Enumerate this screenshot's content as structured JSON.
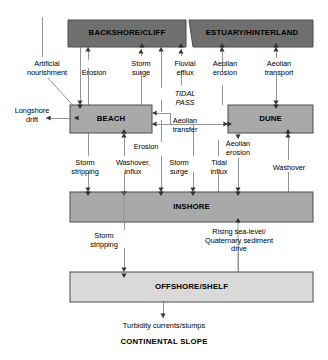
{
  "diagram": {
    "colors": {
      "dark_box_fill": "#6f6f6f",
      "mid_box_fill": "#a9a9a9",
      "light_box_fill": "#d9d9d9",
      "box_stroke": "#4d4d4d",
      "line": "#808080",
      "arrow": "#3a3a3a",
      "text": "#000000",
      "background": "#ffffff"
    },
    "boxes": [
      {
        "id": "backshore",
        "label": "BACKSHORE/CLIFF",
        "tone": "dark",
        "x": 68,
        "y": 20,
        "w": 118,
        "h": 27
      },
      {
        "id": "estuary",
        "label": "ESTUARY/HINTERLAND",
        "tone": "dark",
        "x": 191,
        "y": 20,
        "w": 122,
        "h": 27
      },
      {
        "id": "beach",
        "label": "BEACH",
        "tone": "mid",
        "x": 70,
        "y": 105,
        "w": 82,
        "h": 28
      },
      {
        "id": "dune",
        "label": "DUNE",
        "tone": "mid",
        "x": 228,
        "y": 105,
        "w": 85,
        "h": 28
      },
      {
        "id": "inshore",
        "label": "INSHORE",
        "tone": "mid",
        "x": 70,
        "y": 192,
        "w": 243,
        "h": 30
      },
      {
        "id": "offshore",
        "label": "OFFSHORE/SHELF",
        "tone": "light",
        "x": 70,
        "y": 272,
        "w": 243,
        "h": 30
      }
    ],
    "flow_labels": [
      {
        "id": "artificial-nourishment",
        "text": "Artificial\nnourishment",
        "x": 6,
        "y": 60,
        "w": 82,
        "italic": false
      },
      {
        "id": "erosion-backshore",
        "text": "Erosion",
        "x": 72,
        "y": 69,
        "w": 44,
        "italic": false
      },
      {
        "id": "storm-surge-backshore",
        "text": "Storm\nsurge",
        "x": 118,
        "y": 60,
        "w": 46,
        "italic": false
      },
      {
        "id": "fluvial-efflux",
        "text": "Fluvial\nefflux",
        "x": 162,
        "y": 60,
        "w": 46,
        "italic": false
      },
      {
        "id": "aeolian-erosion-top",
        "text": "Aeolian\nerosion",
        "x": 203,
        "y": 60,
        "w": 46,
        "italic": false
      },
      {
        "id": "aeolian-transport",
        "text": "Aeolian\ntransport",
        "x": 252,
        "y": 60,
        "w": 56,
        "italic": false
      },
      {
        "id": "tidal-pass",
        "text": "TIDAL\nPASS",
        "x": 162,
        "y": 90,
        "w": 46,
        "italic": true
      },
      {
        "id": "longshore-drift",
        "text": "Longshore\ndrift",
        "x": 5,
        "y": 107,
        "w": 56,
        "italic": false
      },
      {
        "id": "aeolian-transfer",
        "text": "Aeolian\ntransfer",
        "x": 160,
        "y": 117,
        "w": 52,
        "italic": false
      },
      {
        "id": "erosion-beach",
        "text": "Erosion",
        "x": 123,
        "y": 143,
        "w": 44,
        "italic": false
      },
      {
        "id": "aeolian-erosion-dune",
        "text": "Aeolian\nerosion",
        "x": 215,
        "y": 140,
        "w": 46,
        "italic": false
      },
      {
        "id": "storm-stripping-inshore",
        "text": "Storm\nstripping",
        "x": 57,
        "y": 159,
        "w": 56,
        "italic": false
      },
      {
        "id": "washover-influx",
        "text": "Washover,\ninflux",
        "x": 105,
        "y": 159,
        "w": 56,
        "italic": false
      },
      {
        "id": "storm-surge-inshore",
        "text": "Storm\nsurge",
        "x": 155,
        "y": 159,
        "w": 46,
        "italic": false
      },
      {
        "id": "tidal-influx",
        "text": "Tidal\ninflux",
        "x": 197,
        "y": 159,
        "w": 42,
        "italic": false
      },
      {
        "id": "washover-dune",
        "text": "Washover",
        "x": 261,
        "y": 164,
        "w": 56,
        "italic": false
      },
      {
        "id": "storm-stripping-offshore",
        "text": "Storm\nstripping",
        "x": 76,
        "y": 232,
        "w": 56,
        "italic": false
      },
      {
        "id": "rising-sea-level",
        "text": "Rising sea-level/\nQuaternary sediment\ndrive",
        "x": 184,
        "y": 228,
        "w": 110,
        "italic": false
      }
    ],
    "bottom": {
      "turbidity_label": "Turbidity currents/slumps",
      "continental_slope": "CONTINENTAL SLOPE"
    }
  }
}
